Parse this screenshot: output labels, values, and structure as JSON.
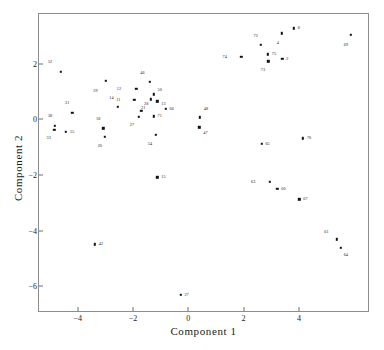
{
  "chart_data": {
    "type": "scatter",
    "title": "",
    "xlabel": "Component 1",
    "ylabel": "Component 2",
    "xlim": [
      -5.4,
      6.5
    ],
    "ylim": [
      -6.9,
      3.8
    ],
    "xticks": [
      -4,
      -2,
      0,
      2,
      4
    ],
    "xticklabels": [
      "−4",
      "−2",
      "0",
      "2",
      "4"
    ],
    "yticks": [
      2,
      0,
      -2,
      -4,
      -6
    ],
    "yticklabels": [
      "2",
      "0",
      "−2",
      "−4",
      "−6"
    ],
    "grid": false,
    "legend": null,
    "marker_color": "#111111",
    "frame_color": "#8d8d8d",
    "points": [
      {
        "label": "52",
        "x": -4.62,
        "y": 1.72,
        "lx": -0.3,
        "ly": 0.34
      },
      {
        "label": "29",
        "x": -2.98,
        "y": 1.4,
        "lx": -0.3,
        "ly": -0.36
      },
      {
        "label": "46",
        "x": -1.4,
        "y": 1.35,
        "lx": -0.18,
        "ly": 0.32
      },
      {
        "label": "12",
        "x": -1.88,
        "y": 1.1,
        "lx": -0.55,
        "ly": 0.0
      },
      {
        "label": "50",
        "x": -1.25,
        "y": 0.9,
        "lx": 0.14,
        "ly": 0.16
      },
      {
        "label": "14",
        "x": -2.55,
        "y": 0.45,
        "lx": -0.15,
        "ly": 0.32
      },
      {
        "label": "11",
        "x": -1.95,
        "y": 0.7,
        "lx": -0.5,
        "ly": 0.0
      },
      {
        "label": "21",
        "x": -1.35,
        "y": 0.72,
        "lx": -0.2,
        "ly": -0.3
      },
      {
        "label": "13",
        "x": -1.12,
        "y": 0.65,
        "lx": 0.14,
        "ly": -0.1
      },
      {
        "label": "31",
        "x": -4.2,
        "y": 0.25,
        "lx": -0.1,
        "ly": 0.34
      },
      {
        "label": "28",
        "x": -1.7,
        "y": 0.32,
        "lx": 0.1,
        "ly": 0.24
      },
      {
        "label": "27",
        "x": -1.78,
        "y": 0.1,
        "lx": -0.18,
        "ly": -0.3
      },
      {
        "label": "71",
        "x": -1.25,
        "y": 0.12,
        "lx": 0.14,
        "ly": 0.0
      },
      {
        "label": "66",
        "x": -0.82,
        "y": 0.38,
        "lx": 0.14,
        "ly": 0.0
      },
      {
        "label": "38",
        "x": -4.82,
        "y": -0.22,
        "lx": -0.1,
        "ly": 0.34
      },
      {
        "label": "33",
        "x": -4.85,
        "y": -0.38,
        "lx": -0.12,
        "ly": -0.3
      },
      {
        "label": "55",
        "x": -4.42,
        "y": -0.45,
        "lx": 0.14,
        "ly": 0.0
      },
      {
        "label": "18",
        "x": -3.08,
        "y": -0.32,
        "lx": -0.1,
        "ly": 0.34
      },
      {
        "label": "20",
        "x": -3.02,
        "y": -0.62,
        "lx": -0.1,
        "ly": -0.34
      },
      {
        "label": "54",
        "x": -1.17,
        "y": -0.55,
        "lx": -0.14,
        "ly": -0.34
      },
      {
        "label": "48",
        "x": 0.42,
        "y": 0.08,
        "lx": 0.14,
        "ly": 0.28
      },
      {
        "label": "47",
        "x": 0.4,
        "y": -0.28,
        "lx": 0.14,
        "ly": -0.22
      },
      {
        "label": "74",
        "x": 1.92,
        "y": 2.25,
        "lx": -0.52,
        "ly": 0.0
      },
      {
        "label": "72",
        "x": 2.62,
        "y": 2.68,
        "lx": -0.1,
        "ly": 0.34
      },
      {
        "label": "75",
        "x": 2.88,
        "y": 2.35,
        "lx": 0.14,
        "ly": 0.0
      },
      {
        "label": "73",
        "x": 2.9,
        "y": 2.1,
        "lx": -0.12,
        "ly": -0.32
      },
      {
        "label": "2",
        "x": 3.4,
        "y": 2.18,
        "lx": 0.14,
        "ly": 0.0
      },
      {
        "label": "4",
        "x": 3.38,
        "y": 3.1,
        "lx": -0.1,
        "ly": -0.34
      },
      {
        "label": "8",
        "x": 3.82,
        "y": 3.28,
        "lx": 0.14,
        "ly": 0.0
      },
      {
        "label": "69",
        "x": 5.88,
        "y": 3.05,
        "lx": -0.1,
        "ly": -0.36
      },
      {
        "label": "65",
        "x": 2.65,
        "y": -0.88,
        "lx": 0.14,
        "ly": 0.0
      },
      {
        "label": "70",
        "x": 4.15,
        "y": -0.68,
        "lx": 0.14,
        "ly": 0.0
      },
      {
        "label": "63",
        "x": 2.95,
        "y": -2.25,
        "lx": -0.52,
        "ly": 0.0
      },
      {
        "label": "60",
        "x": 3.22,
        "y": -2.5,
        "lx": 0.14,
        "ly": 0.0
      },
      {
        "label": "67",
        "x": 4.02,
        "y": -2.88,
        "lx": 0.14,
        "ly": 0.0
      },
      {
        "label": "15",
        "x": -1.12,
        "y": -2.08,
        "lx": 0.14,
        "ly": 0.0
      },
      {
        "label": "42",
        "x": -3.38,
        "y": -4.5,
        "lx": 0.14,
        "ly": 0.0
      },
      {
        "label": "61",
        "x": 5.38,
        "y": -4.32,
        "lx": -0.3,
        "ly": 0.28
      },
      {
        "label": "64",
        "x": 5.52,
        "y": -4.62,
        "lx": 0.1,
        "ly": -0.26
      },
      {
        "label": "27b",
        "x": -0.28,
        "y": -6.32,
        "lx": 0.14,
        "ly": 0.0,
        "display_label": "27"
      }
    ]
  }
}
